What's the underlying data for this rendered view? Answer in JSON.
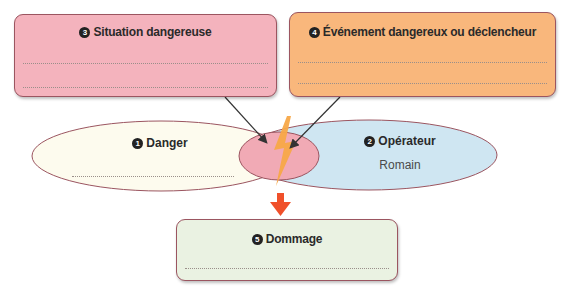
{
  "boxes": {
    "situation": {
      "number": "3",
      "title": "Situation dangereuse",
      "color": "#f4b3bd",
      "answer_lines": 2
    },
    "evenement": {
      "number": "4",
      "title": "Événement dangereux ou déclencheur",
      "color": "#f9b77c",
      "answer_lines": 2
    },
    "dommage": {
      "number": "5",
      "title": "Dommage",
      "color": "#eaf2e2",
      "answer_lines": 1
    }
  },
  "ellipses": {
    "danger": {
      "number": "1",
      "title": "Danger",
      "value": "",
      "color": "#fdfbee"
    },
    "operateur": {
      "number": "2",
      "title": "Opérateur",
      "value": "Romain",
      "color": "#cfe6f2"
    },
    "intersection_color": "#f1aab5"
  },
  "colors": {
    "border": "#9b5560",
    "arrow": "#f0502a",
    "lightning": "#f7a848",
    "connector": "#333333"
  }
}
